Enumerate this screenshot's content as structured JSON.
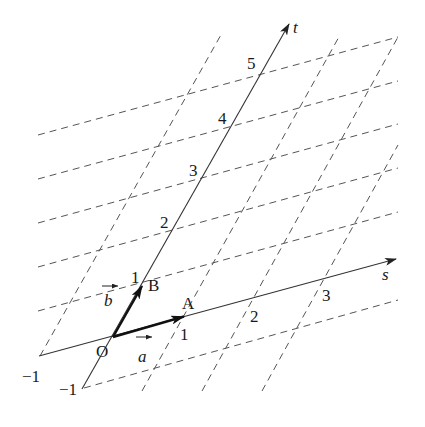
{
  "figure": {
    "origin": {
      "label": "O",
      "x": 113,
      "y": 337
    },
    "basis": {
      "a": {
        "dx": 71,
        "dy": -20.5,
        "label": "a",
        "point_label": "A"
      },
      "b": {
        "dx": 29,
        "dy": -51,
        "label": "b",
        "point_label": "B"
      }
    },
    "axes": {
      "s": {
        "label": "s",
        "from": [
          39,
          356
        ],
        "to": [
          396,
          259
        ],
        "label_pos": [
          382,
          280
        ]
      },
      "t": {
        "label": "t",
        "from": [
          82,
          389
        ],
        "to": [
          289,
          24
        ],
        "label_pos": [
          293,
          33
        ]
      }
    },
    "s_ticks": [
      {
        "value": "-1",
        "label": "−1",
        "pos": [
          22,
          382
        ]
      },
      {
        "value": "1",
        "label": "1",
        "pos": [
          180,
          340
        ]
      },
      {
        "value": "2",
        "label": "2",
        "pos": [
          250,
          322
        ]
      },
      {
        "value": "3",
        "label": "3",
        "pos": [
          322,
          301
        ]
      }
    ],
    "t_ticks": [
      {
        "value": "-1",
        "label": "−1",
        "pos": [
          59,
          395
        ]
      },
      {
        "value": "1",
        "label": "1",
        "pos": [
          131,
          283
        ]
      },
      {
        "value": "2",
        "label": "2",
        "pos": [
          160,
          228
        ]
      },
      {
        "value": "3",
        "label": "3",
        "pos": [
          189,
          176
        ]
      },
      {
        "value": "4",
        "label": "4",
        "pos": [
          218,
          124
        ]
      },
      {
        "value": "5",
        "label": "5",
        "pos": [
          247,
          69
        ]
      }
    ],
    "grid_lines_const_t": [
      {
        "t": 5,
        "from": [
          38,
          135
        ],
        "to": [
          398,
          37
        ]
      },
      {
        "t": 4,
        "from": [
          38,
          179
        ],
        "to": [
          398,
          81
        ]
      },
      {
        "t": 3,
        "from": [
          38,
          223
        ],
        "to": [
          398,
          124
        ]
      },
      {
        "t": 2,
        "from": [
          38,
          267
        ],
        "to": [
          398,
          168
        ]
      },
      {
        "t": 1,
        "from": [
          38,
          311
        ],
        "to": [
          398,
          212
        ]
      },
      {
        "t": -1,
        "from": [
          84,
          388
        ],
        "to": [
          398,
          300
        ]
      }
    ],
    "grid_lines_const_s": [
      {
        "s": -1,
        "from": [
          40,
          356
        ],
        "to": [
          222,
          33
        ]
      },
      {
        "s": 1,
        "from": [
          142,
          391
        ],
        "to": [
          340,
          35
        ]
      },
      {
        "s": 2,
        "from": [
          202,
          391
        ],
        "to": [
          398,
          37
        ]
      },
      {
        "s": 3,
        "from": [
          262,
          391
        ],
        "to": [
          398,
          145
        ]
      }
    ],
    "labels": {
      "origin": "O",
      "point_a": "A",
      "point_b": "B",
      "vec_a": "a",
      "vec_b": "b",
      "axis_s": "s",
      "axis_t": "t"
    },
    "colors": {
      "line": "#333333",
      "grid": "#555555",
      "text": "#1a1a1a",
      "background": "#ffffff"
    }
  }
}
